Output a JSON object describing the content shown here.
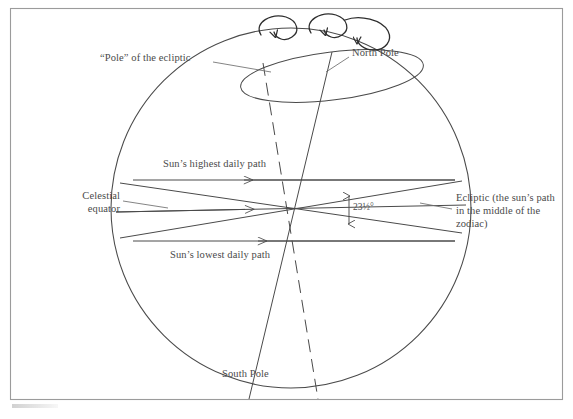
{
  "figure": {
    "frame": {
      "stroke": "#8a8a8a"
    },
    "ink": "#4a4a4a",
    "background": "#ffffff"
  },
  "labels": {
    "pole_of_ecliptic": "“Pole” of the ecliptic",
    "north_pole": "North Pole",
    "south_pole": "South Pole",
    "suns_highest_daily_path": "Sun’s highest daily path",
    "suns_lowest_daily_path": "Sun’s lowest daily path",
    "celestial_equator": "Celestial equator",
    "ecliptic": "Ecliptic (the sun’s path in the middle of the zodiac)",
    "tilt_value": "23",
    "tilt_fraction": "½",
    "tilt_degree": "°",
    "tilt_full": "23½°"
  },
  "geometry": {
    "sphere_center": {
      "x": 291,
      "y": 208
    },
    "sphere_radius": 180,
    "obliquity_degrees": 23.5,
    "precession_arrows": 3
  },
  "icons": {
    "precession_arrow": "curved-rotation-arrow",
    "path_arrow_west": "left-arrowhead",
    "equator_arrow_east": "right-arrowhead",
    "tilt_arrow": "double-headed-vertical-arrow"
  }
}
